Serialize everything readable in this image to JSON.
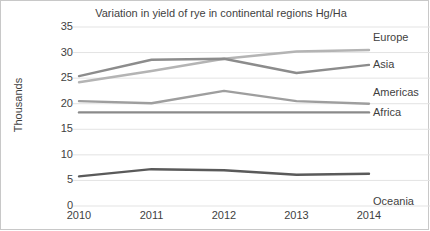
{
  "chart_data": {
    "type": "line",
    "title": "Variation in yield of rye in continental regions Hg/Ha",
    "xlabel": "",
    "ylabel": "Thousands",
    "categories": [
      "2010",
      "2011",
      "2012",
      "2013",
      "2014"
    ],
    "x": [
      2010,
      2011,
      2012,
      2013,
      2014
    ],
    "ylim": [
      0,
      35
    ],
    "ytick_step": 5,
    "yticks": [
      "35",
      "30",
      "25",
      "20",
      "15",
      "10",
      "5",
      "0"
    ],
    "grid": true,
    "legend_position": "right-of-plot-line-end",
    "series": [
      {
        "name": "Europe",
        "color": "#b4b4b4",
        "values": [
          24.2,
          26.4,
          28.8,
          30.2,
          30.5
        ]
      },
      {
        "name": "Asia",
        "color": "#8c8c8c",
        "values": [
          25.4,
          28.6,
          28.8,
          26.0,
          27.6
        ]
      },
      {
        "name": "Americas",
        "color": "#9e9e9e",
        "values": [
          20.5,
          20.1,
          22.5,
          20.5,
          20.0
        ]
      },
      {
        "name": "Africa",
        "color": "#8a8a8a",
        "values": [
          18.3,
          18.3,
          18.3,
          18.3,
          18.3
        ]
      },
      {
        "name": "Oceania",
        "color": "#5a5a5a",
        "values": [
          5.8,
          7.2,
          7.0,
          6.1,
          6.3
        ]
      }
    ]
  },
  "colors": {
    "grid": "#e3e3e3",
    "text": "#3f3f3f",
    "border": "#c8c8c8",
    "background": "#ffffff"
  }
}
